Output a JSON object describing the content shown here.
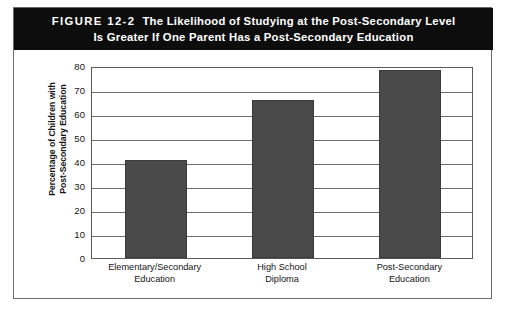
{
  "figure": {
    "number_label": "FIGURE 12-2",
    "title_line_1": "The Likelihood of Studying at the Post-Secondary Level",
    "title_line_2": "Is Greater If One Parent Has a Post-Secondary Education",
    "banner_background": "#0d0d0d",
    "banner_text_color": "#ffffff",
    "frame_border_color": "#6b6b6b"
  },
  "chart_data": {
    "type": "bar",
    "title": "The Likelihood of Studying at the Post-Secondary Level Is Greater If One Parent Has a Post-Secondary Education",
    "categories": [
      "Elementary/Secondary Education",
      "High School Diploma",
      "Post-Secondary Education"
    ],
    "category_lines": [
      [
        "Elementary/Secondary",
        "Education"
      ],
      [
        "High School",
        "Diploma"
      ],
      [
        "Post-Secondary",
        "Education"
      ]
    ],
    "values": [
      41,
      66,
      78.5
    ],
    "xlabel": "",
    "ylabel": "Percentage of Children with Post-Secondary Education",
    "ylabel_lines": [
      "Percentage of Children with",
      "Post-Secondary Education"
    ],
    "ylim": [
      0,
      80
    ],
    "ytick_values": [
      0,
      10,
      20,
      30,
      40,
      50,
      60,
      70,
      80
    ],
    "ytick_labels": [
      "0",
      "10",
      "20",
      "30",
      "40",
      "50",
      "60",
      "70",
      "80"
    ],
    "grid": true,
    "grid_axis": "y",
    "legend": false,
    "bar_color": "#4a4a4a",
    "gridline_color": "#6e6e6e",
    "axis_color": "#5a5a5a",
    "plot_background": "#ffffff"
  }
}
